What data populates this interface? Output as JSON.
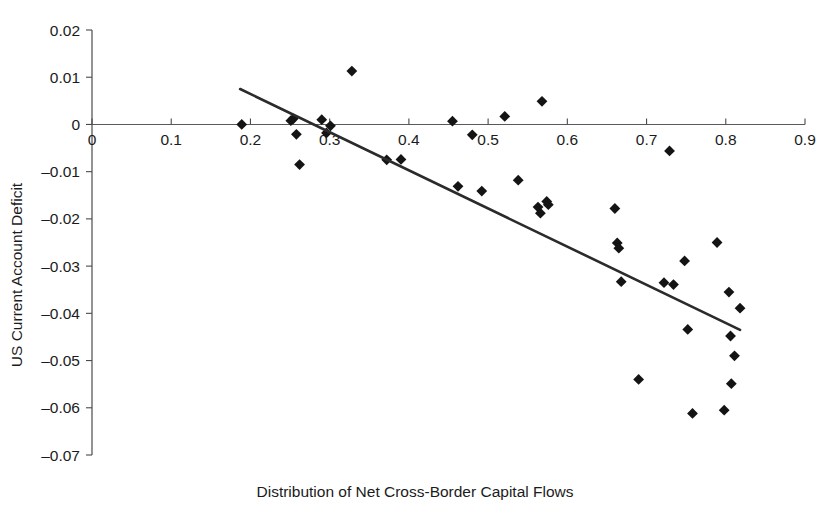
{
  "chart_data": {
    "type": "scatter",
    "title": "",
    "xlabel": "Distribution of Net Cross-Border Capital Flows",
    "ylabel": "US Current Account Deficit",
    "xlim": [
      0,
      0.9
    ],
    "ylim": [
      -0.07,
      0.02
    ],
    "grid": false,
    "legend": null,
    "x_ticks": [
      0,
      0.1,
      0.2,
      0.3,
      0.4,
      0.5,
      0.6,
      0.7,
      0.8,
      0.9
    ],
    "x_tick_labels": [
      "0",
      "0.1",
      "0.2",
      "0.3",
      "0.4",
      "0.5",
      "0.6",
      "0.7",
      "0.8",
      "0.9"
    ],
    "y_ticks": [
      0.02,
      0.01,
      0,
      -0.01,
      -0.02,
      -0.03,
      -0.04,
      -0.05,
      -0.06,
      -0.07
    ],
    "y_tick_labels": [
      "0.02",
      "0.01",
      "0",
      "-0.01",
      "-0.02",
      "-0.03",
      "-0.04",
      "-0.05",
      "-0.06",
      "-0.07"
    ],
    "marker_shape": "diamond",
    "marker_color": "#141414",
    "series": [
      {
        "name": "Observations",
        "points": [
          [
            0.189,
            0.0
          ],
          [
            0.251,
            0.0008
          ],
          [
            0.254,
            0.0012
          ],
          [
            0.258,
            -0.0021
          ],
          [
            0.262,
            -0.0085
          ],
          [
            0.29,
            0.001
          ],
          [
            0.296,
            -0.0018
          ],
          [
            0.301,
            -0.0003
          ],
          [
            0.328,
            0.0113
          ],
          [
            0.372,
            -0.0075
          ],
          [
            0.39,
            -0.0074
          ],
          [
            0.455,
            0.0007
          ],
          [
            0.462,
            -0.0131
          ],
          [
            0.48,
            -0.0022
          ],
          [
            0.492,
            -0.0141
          ],
          [
            0.521,
            0.0017
          ],
          [
            0.538,
            -0.0118
          ],
          [
            0.563,
            -0.0175
          ],
          [
            0.566,
            -0.0188
          ],
          [
            0.568,
            0.0049
          ],
          [
            0.574,
            -0.0163
          ],
          [
            0.576,
            -0.017
          ],
          [
            0.66,
            -0.0178
          ],
          [
            0.663,
            -0.0251
          ],
          [
            0.665,
            -0.0262
          ],
          [
            0.668,
            -0.0333
          ],
          [
            0.69,
            -0.054
          ],
          [
            0.722,
            -0.0335
          ],
          [
            0.729,
            -0.0056
          ],
          [
            0.734,
            -0.0339
          ],
          [
            0.748,
            -0.0289
          ],
          [
            0.752,
            -0.0434
          ],
          [
            0.758,
            -0.0612
          ],
          [
            0.789,
            -0.025
          ],
          [
            0.798,
            -0.0605
          ],
          [
            0.804,
            -0.0355
          ],
          [
            0.806,
            -0.0448
          ],
          [
            0.807,
            -0.0549
          ],
          [
            0.811,
            -0.049
          ],
          [
            0.818,
            -0.0389
          ]
        ]
      }
    ],
    "trend_line": {
      "name": "Linear fit",
      "x_start": 0.187,
      "y_start": 0.0075,
      "x_end": 0.818,
      "y_end": -0.0435,
      "color": "#2b2b2b"
    }
  }
}
